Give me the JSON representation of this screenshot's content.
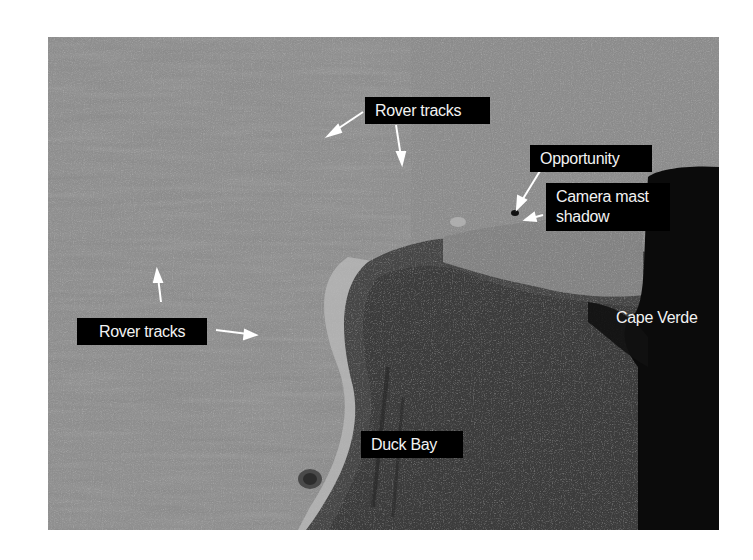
{
  "figure": {
    "colors": {
      "plains": "#8e8e8e",
      "crater_floor": "#3a3a3a",
      "cape_shadow": "#050505",
      "label_bg": "#000000",
      "label_text": "#f2f2f2",
      "arrow": "#ffffff"
    },
    "labels": {
      "rover_tracks_top": "Rover tracks",
      "opportunity": "Opportunity",
      "camera_mast_line1": "Camera mast",
      "camera_mast_line2": "shadow",
      "rover_tracks_left": "Rover tracks",
      "cape_verde": "Cape Verde",
      "duck_bay": "Duck Bay"
    }
  }
}
